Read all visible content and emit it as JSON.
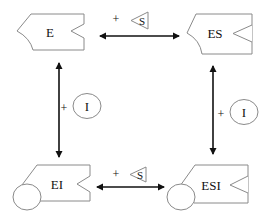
{
  "diagram": {
    "nodes": {
      "e": {
        "label": "E"
      },
      "es": {
        "label": "ES"
      },
      "ei": {
        "label": "EI"
      },
      "esi": {
        "label": "ESI"
      }
    },
    "edges": {
      "top": {
        "from": "E",
        "to": "ES",
        "plus": "+",
        "ligand": "S",
        "bidirectional": true
      },
      "bottom": {
        "from": "EI",
        "to": "ESI",
        "plus": "+",
        "ligand": "S",
        "bidirectional": true
      },
      "left": {
        "from": "E",
        "to": "EI",
        "plus": "+",
        "ligand": "I",
        "bidirectional": true
      },
      "right": {
        "from": "ES",
        "to": "ESI",
        "plus": "+",
        "ligand": "I",
        "bidirectional": true
      }
    },
    "colors": {
      "outline": "#8a8a8a",
      "arrow": "#111111",
      "background": "#ffffff"
    }
  }
}
